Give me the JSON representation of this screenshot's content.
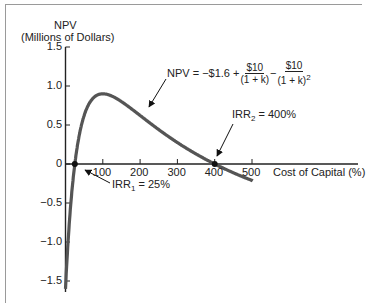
{
  "chart_data": {
    "type": "line",
    "title": "",
    "ylabel_line1": "NPV",
    "ylabel_line2": "(Millions of Dollars)",
    "xlabel": "Cost of Capital (%)",
    "xlim": [
      0,
      540
    ],
    "ylim": [
      -1.6,
      1.5
    ],
    "x_ticks": [
      100,
      200,
      300,
      400,
      500
    ],
    "x_tick_labels": [
      "100",
      "200",
      "300",
      "400",
      "500"
    ],
    "y_ticks": [
      1.5,
      1.0,
      0.5,
      0,
      -0.5,
      -1.0,
      -1.5
    ],
    "y_tick_labels": [
      "1.5",
      "1.0",
      "0.5",
      "0",
      "−0.5",
      "−1.0",
      "−1.5"
    ],
    "grid": false,
    "legend": null,
    "series": [
      {
        "name": "NPV",
        "x": [
          0,
          5,
          10,
          15,
          20,
          25,
          30,
          40,
          50,
          60,
          70,
          80,
          100,
          120,
          150,
          200,
          250,
          300,
          350,
          400,
          450,
          500
        ],
        "values": [
          -1.6,
          -1.15,
          -0.77,
          -0.44,
          -0.21,
          0.0,
          0.17,
          0.42,
          0.62,
          0.74,
          0.81,
          0.85,
          0.9,
          0.86,
          0.8,
          0.62,
          0.4,
          0.28,
          0.14,
          0.0,
          -0.09,
          -0.21
        ]
      }
    ],
    "annotations": {
      "formula": {
        "lhs": "NPV = −$1.6 +",
        "frac1_num": "$10",
        "frac1_den": "(1 + k)",
        "minus": "−",
        "frac2_num": "$10",
        "frac2_den": "(1 + k)",
        "frac2_exp": "2"
      },
      "irr1": {
        "prefix": "IRR",
        "sub": "1",
        "suffix": " = 25%",
        "x": 25,
        "y": 0
      },
      "irr2": {
        "prefix": "IRR",
        "sub": "2",
        "suffix": " = 400%",
        "x": 400,
        "y": 0
      }
    }
  }
}
